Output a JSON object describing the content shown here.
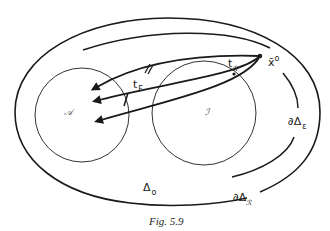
{
  "figure": {
    "caption": "Fig. 5.9",
    "colors": {
      "stroke": "#1a1a1a",
      "background": "#ffffff"
    }
  },
  "labels": {
    "set_A": "𝒜",
    "set_I": "ℐ",
    "point_x0_base": "x̄",
    "point_x0_sup": "o",
    "t_F_base": "t",
    "t_F_sub": "F",
    "t_R_base": "t",
    "t_R_sub": "ℛ",
    "delta_0_base": "Δ",
    "delta_0_sub": "o",
    "boundary_eps_base": "∂Δ",
    "boundary_eps_sub": "ε",
    "boundary_R_base": "∂Δ",
    "boundary_R_sub": "ℛ"
  }
}
